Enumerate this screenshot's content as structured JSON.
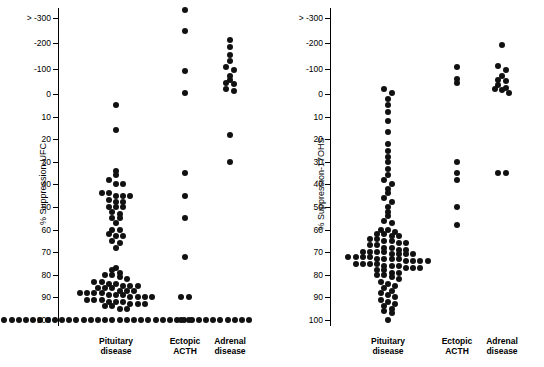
{
  "chart_data": [
    {
      "type": "scatter",
      "panel": "left",
      "title": "",
      "ylabel": "% Suppression-UFC",
      "xlabel": "",
      "categories": [
        "Pituitary disease",
        "Ectopic ACTH",
        "Adrenal disease"
      ],
      "category_labels": [
        [
          "Pituitary",
          "disease"
        ],
        [
          "Ectopic",
          "ACTH"
        ],
        [
          "Adrenal",
          "disease"
        ]
      ],
      "ytick_labels": [
        "> -300",
        "-200",
        "-100",
        "0",
        "10",
        "20",
        "30",
        "40",
        "50",
        "60",
        "70",
        "80",
        "90",
        "100"
      ],
      "ytick_values": [
        -300,
        -200,
        -100,
        0,
        10,
        20,
        30,
        40,
        50,
        60,
        70,
        80,
        90,
        100
      ],
      "yaxis_inverted": true,
      "grid": false,
      "legend": "none",
      "series": [
        {
          "name": "Pituitary disease",
          "x_center": 0,
          "values": [
            5,
            16,
            34,
            36,
            38,
            40,
            40,
            44,
            44,
            45,
            45,
            45,
            47,
            48,
            48,
            50,
            50,
            50,
            52,
            53,
            55,
            55,
            57,
            60,
            60,
            62,
            63,
            63,
            65,
            66,
            68,
            77,
            78,
            79,
            80,
            80,
            81,
            82,
            83,
            83,
            84,
            84,
            85,
            85,
            85,
            86,
            86,
            86,
            87,
            87,
            87,
            88,
            88,
            88,
            88,
            89,
            89,
            89,
            90,
            90,
            90,
            90,
            91,
            91,
            91,
            92,
            92,
            92,
            93,
            93,
            93,
            94,
            94,
            95,
            95,
            100,
            100,
            100,
            100,
            100,
            100,
            100,
            100,
            100,
            100,
            100,
            100,
            100,
            100,
            100,
            100,
            100,
            100,
            100,
            100,
            100,
            100,
            100,
            100,
            100,
            100,
            100,
            100,
            100,
            100,
            100,
            100,
            100,
            100,
            100,
            100,
            100,
            100
          ]
        },
        {
          "name": "Ectopic ACTH",
          "x_center": 1,
          "values": [
            -330,
            -250,
            -90,
            -5,
            35,
            45,
            55,
            72,
            90,
            90,
            100,
            100
          ]
        },
        {
          "name": "Adrenal disease",
          "x_center": 2,
          "values": [
            -215,
            -185,
            -155,
            -130,
            -105,
            -95,
            -70,
            -55,
            -45,
            -40,
            -20,
            -10,
            18,
            30
          ]
        }
      ]
    },
    {
      "type": "scatter",
      "panel": "right",
      "title": "",
      "ylabel": "% Suppression-17OHS",
      "xlabel": "",
      "categories": [
        "Pituitary disease",
        "Ectopic ACTH",
        "Adrenal disease"
      ],
      "category_labels": [
        [
          "Pituitary",
          "disease"
        ],
        [
          "Ectopic",
          "ACTH"
        ],
        [
          "Adrenal",
          "disease"
        ]
      ],
      "ytick_labels": [
        "> -300",
        "-200",
        "-100",
        "0",
        "10",
        "20",
        "30",
        "40",
        "50",
        "60",
        "70",
        "80",
        "90",
        "100"
      ],
      "ytick_values": [
        -300,
        -200,
        -100,
        0,
        10,
        20,
        30,
        40,
        50,
        60,
        70,
        80,
        90,
        100
      ],
      "yaxis_inverted": true,
      "grid": false,
      "legend": "none",
      "series": [
        {
          "name": "Pituitary disease",
          "x_center": 0,
          "values": [
            -20,
            -5,
            2,
            5,
            8,
            12,
            17,
            22,
            25,
            28,
            30,
            33,
            36,
            38,
            40,
            42,
            44,
            46,
            48,
            50,
            52,
            54,
            56,
            57,
            60,
            60,
            61,
            62,
            62,
            63,
            63,
            64,
            64,
            65,
            65,
            66,
            66,
            67,
            67,
            68,
            68,
            69,
            69,
            70,
            70,
            70,
            70,
            71,
            71,
            71,
            71,
            72,
            72,
            72,
            72,
            73,
            73,
            73,
            73,
            74,
            74,
            74,
            74,
            75,
            75,
            75,
            75,
            76,
            76,
            76,
            77,
            77,
            77,
            78,
            78,
            79,
            79,
            80,
            80,
            81,
            82,
            83,
            84,
            85,
            86,
            87,
            88,
            89,
            90,
            91,
            92,
            93,
            94,
            95,
            96,
            97,
            100
          ]
        },
        {
          "name": "Ectopic ACTH",
          "x_center": 1,
          "values": [
            -105,
            -60,
            -45,
            30,
            35,
            38,
            50,
            58
          ]
        },
        {
          "name": "Adrenal disease",
          "x_center": 2,
          "values": [
            -195,
            -110,
            -95,
            -70,
            -55,
            -50,
            -35,
            -25,
            -20,
            -15,
            -5,
            35,
            35
          ]
        }
      ]
    }
  ]
}
